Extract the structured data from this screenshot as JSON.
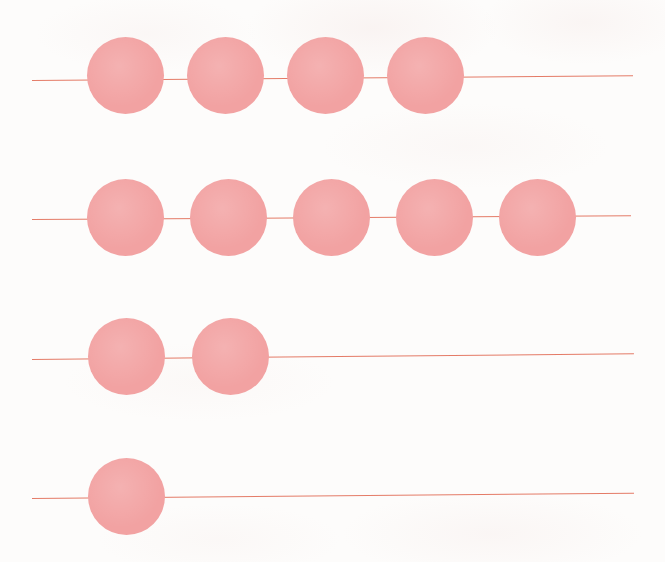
{
  "figure": {
    "background_color": "#fdfcfb",
    "bead_color": "#f2a2a2",
    "rod_color": "#e2705a",
    "width": 665,
    "height": 562
  },
  "chart_data": {
    "type": "bar",
    "subtitle": "",
    "xlabel": "",
    "ylabel": "",
    "orientation": "horizontal",
    "unit": "beads",
    "grid": false,
    "legend": false,
    "axis_ticks": [],
    "categories": [
      "Row 1",
      "Row 2",
      "Row 3",
      "Row 4"
    ],
    "values": [
      4,
      5,
      2,
      1
    ],
    "xlim": [
      0,
      6
    ],
    "annotations": []
  },
  "rows": [
    {
      "name": "row-1",
      "count": 4,
      "bead_diameter": 77,
      "bead_top": 37,
      "rod_y": 80,
      "rod_start_x": 32,
      "rod_end_x": 633,
      "rod_tilt_deg": -0.45,
      "bead_start_x": 87,
      "bead_pitch": 100
    },
    {
      "name": "row-2",
      "count": 5,
      "bead_diameter": 77,
      "bead_top": 179,
      "rod_y": 219,
      "rod_start_x": 32,
      "rod_end_x": 631,
      "rod_tilt_deg": -0.35,
      "bead_start_x": 87,
      "bead_pitch": 103
    },
    {
      "name": "row-3",
      "count": 2,
      "bead_diameter": 77,
      "bead_top": 318,
      "rod_y": 359,
      "rod_start_x": 32,
      "rod_end_x": 634,
      "rod_tilt_deg": -0.55,
      "bead_start_x": 88,
      "bead_pitch": 104
    },
    {
      "name": "row-4",
      "count": 1,
      "bead_diameter": 77,
      "bead_top": 458,
      "rod_y": 498,
      "rod_start_x": 32,
      "rod_end_x": 634,
      "rod_tilt_deg": -0.5,
      "bead_start_x": 88,
      "bead_pitch": 104
    }
  ]
}
